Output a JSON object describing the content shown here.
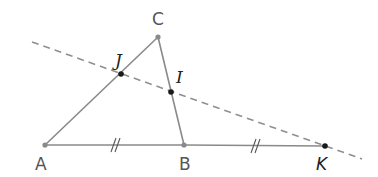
{
  "diagram": {
    "colors": {
      "segment": "#8a8a8a",
      "dashed_line": "#8f8f8f",
      "midpoint_dot": "#1a1a1a",
      "vertex_dot": "#8a8a8a",
      "label_vertex": "#555555",
      "label_point": "#222222"
    },
    "points": {
      "A": {
        "label": "A",
        "x": 45,
        "y": 145
      },
      "B": {
        "label": "B",
        "x": 184,
        "y": 145
      },
      "C": {
        "label": "C",
        "x": 158,
        "y": 37
      },
      "J": {
        "label": "J",
        "x": 121,
        "y": 74
      },
      "I": {
        "label": "I",
        "x": 171,
        "y": 92
      },
      "K": {
        "label": "K",
        "x": 325,
        "y": 146
      }
    },
    "segments": [
      "AC",
      "CB",
      "AB",
      "BK"
    ],
    "dashed_line": {
      "through": [
        "J",
        "I",
        "K"
      ],
      "from": [
        32,
        42
      ],
      "to": [
        362,
        159
      ]
    },
    "congruence_marks": [
      {
        "segment": "AB",
        "type": "double-tick"
      },
      {
        "segment": "BK",
        "type": "double-tick"
      }
    ]
  }
}
